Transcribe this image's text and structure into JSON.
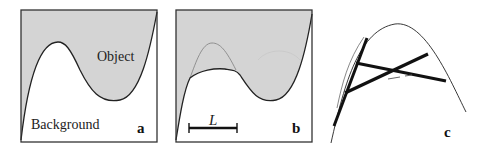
{
  "figure": {
    "fill_color": "#d4d4d4",
    "line_color": "#222222",
    "panels": [
      {
        "id": "a",
        "letter": "a",
        "labels": {
          "object": "Object",
          "background": "Background"
        }
      },
      {
        "id": "b",
        "letter": "b",
        "scale_bar_label": "L"
      },
      {
        "id": "c",
        "letter": "c"
      }
    ]
  }
}
